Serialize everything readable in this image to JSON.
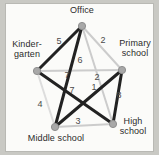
{
  "figure": {
    "background_color": "#c9c9c4",
    "paper_color": "#fbfbf9"
  },
  "chart_data": {
    "type": "diagram",
    "subtype": "weighted-graph",
    "title": "",
    "nodes": [
      {
        "id": "office",
        "label": "Office",
        "x": 82,
        "y": 26,
        "label_x": 82,
        "label_y": 11,
        "label_align": "center"
      },
      {
        "id": "kindergarten",
        "label": "Kinder-\ngarten",
        "x": 37,
        "y": 71,
        "label_x": 27,
        "label_y": 45,
        "label_align": "center"
      },
      {
        "id": "primary_school",
        "label": "Primary\nschool",
        "x": 122,
        "y": 70,
        "label_x": 135,
        "label_y": 44,
        "label_align": "center"
      },
      {
        "id": "middle_school",
        "label": "Middle school",
        "x": 55,
        "y": 127,
        "label_x": 56,
        "label_y": 139,
        "label_align": "center"
      },
      {
        "id": "high_school",
        "label": "High\nschool",
        "x": 113,
        "y": 124,
        "label_x": 133,
        "label_y": 122,
        "label_align": "center"
      }
    ],
    "edges": [
      {
        "from": "office",
        "to": "kindergarten",
        "weight": 5,
        "color": "#222222",
        "width": 3.0,
        "label_x": 59,
        "label_y": 42
      },
      {
        "from": "office",
        "to": "primary_school",
        "weight": 2,
        "color": "#cccccc",
        "width": 2.0,
        "label_x": 103,
        "label_y": 41
      },
      {
        "from": "office",
        "to": "middle_school",
        "weight": 7,
        "color": "#222222",
        "width": 3.0,
        "label_x": 67,
        "label_y": 76
      },
      {
        "from": "office",
        "to": "high_school",
        "weight": 1,
        "color": "#cccccc",
        "width": 2.0,
        "label_x": 94,
        "label_y": 88
      },
      {
        "from": "kindergarten",
        "to": "primary_school",
        "weight": 6,
        "color": "#cccccc",
        "width": 2.0,
        "label_x": 80,
        "label_y": 61
      },
      {
        "from": "kindergarten",
        "to": "middle_school",
        "weight": 4,
        "color": "#dddddd",
        "width": 2.0,
        "label_x": 40,
        "label_y": 105
      },
      {
        "from": "kindergarten",
        "to": "high_school",
        "weight": 7,
        "color": "#222222",
        "width": 3.0,
        "label_x": 72,
        "label_y": 91
      },
      {
        "from": "primary_school",
        "to": "middle_school",
        "weight": 2,
        "color": "#222222",
        "width": 3.0,
        "label_x": 97,
        "label_y": 78
      },
      {
        "from": "primary_school",
        "to": "high_school",
        "weight": 8,
        "color": "#222222",
        "width": 3.0,
        "label_x": 119,
        "label_y": 96
      },
      {
        "from": "middle_school",
        "to": "high_school",
        "weight": 3,
        "color": "#cccccc",
        "width": 2.0,
        "label_x": 78,
        "label_y": 122
      }
    ],
    "node_style": {
      "radius": 3.6,
      "fill": "#a8a8a8",
      "stroke": "#8f8f8f"
    },
    "legend": null,
    "grid": false
  }
}
